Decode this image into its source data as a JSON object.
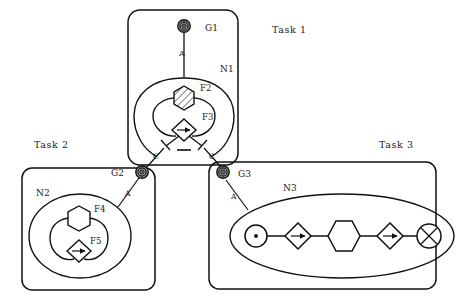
{
  "diagram": {
    "title_labels": [
      {
        "id": "task1",
        "text": "Task  1",
        "x": 272,
        "y": 33
      },
      {
        "id": "task2",
        "text": "Task  2",
        "x": 34,
        "y": 148
      },
      {
        "id": "task3",
        "text": "Task  3",
        "x": 379,
        "y": 148
      }
    ],
    "tasks": [
      {
        "id": "task-1",
        "label": "Task  1",
        "box": {
          "x": 128,
          "y": 10,
          "w": 110,
          "h": 155,
          "rx": 12
        },
        "goal": {
          "id": "G1",
          "label": "G1",
          "label_x": 205,
          "label_y": 32,
          "cx": 184,
          "cy": 26,
          "r": 6,
          "icon": "target-icon"
        },
        "edge": {
          "label": "A",
          "label_x": 180,
          "label_y": 56,
          "from": [
            184,
            33
          ],
          "to": [
            184,
            78
          ]
        },
        "net": {
          "id": "N1",
          "label": "N1",
          "label_x": 222,
          "label_y": 71,
          "features": [
            {
              "id": "F2",
              "label": "F2",
              "label_x": 202,
              "label_y": 90,
              "shape": "hexagon-hatched",
              "cx": 184,
              "cy": 98
            },
            {
              "id": "F3",
              "label": "F3",
              "label_x": 204,
              "label_y": 119,
              "shape": "diamond-arrow",
              "cx": 184,
              "cy": 130
            }
          ]
        },
        "out_edges": [
          {
            "label": "C",
            "label_x": 156,
            "label_y": 156
          },
          {
            "label": "C",
            "label_x": 212,
            "label_y": 156
          }
        ]
      },
      {
        "id": "task-2",
        "label": "Task  2",
        "box": {
          "x": 22,
          "y": 168,
          "w": 133,
          "h": 122,
          "rx": 10
        },
        "goal": {
          "id": "G2",
          "label": "G2",
          "label_x": 113,
          "label_y": 174,
          "cx": 142,
          "cy": 172,
          "r": 6,
          "icon": "target-icon"
        },
        "edge": {
          "label": "A",
          "label_x": 128,
          "label_y": 194
        },
        "net": {
          "id": "N2",
          "label": "N2",
          "label_x": 38,
          "label_y": 194,
          "features": [
            {
              "id": "F4",
              "label": "F4",
              "label_x": 96,
              "label_y": 211,
              "shape": "hexagon",
              "cx": 79,
              "cy": 218
            },
            {
              "id": "F5",
              "label": "F5",
              "label_x": 92,
              "label_y": 243,
              "shape": "diamond-arrow",
              "cx": 79,
              "cy": 251
            }
          ]
        }
      },
      {
        "id": "task-3",
        "label": "Task  3",
        "box": {
          "x": 209,
          "y": 162,
          "w": 227,
          "h": 127,
          "rx": 10
        },
        "goal": {
          "id": "G3",
          "label": "G3",
          "label_x": 240,
          "label_y": 175,
          "cx": 223,
          "cy": 172,
          "r": 6,
          "icon": "target-icon"
        },
        "edge": {
          "label": "A",
          "label_x": 233,
          "label_y": 197
        },
        "net": {
          "id": "N3",
          "label": "N3",
          "label_x": 285,
          "label_y": 190,
          "chain": [
            {
              "id": "n3-start",
              "shape": "circle-dot",
              "cx": 256,
              "cy": 236,
              "r": 11
            },
            {
              "id": "n3-op1",
              "shape": "diamond-arrow",
              "cx": 298,
              "cy": 236,
              "r": 13
            },
            {
              "id": "n3-mid",
              "shape": "hexagon",
              "cx": 344,
              "cy": 236,
              "r": 16
            },
            {
              "id": "n3-op2",
              "shape": "diamond-arrow",
              "cx": 390,
              "cy": 236,
              "r": 13
            },
            {
              "id": "n3-end",
              "shape": "circle-cross",
              "cx": 429,
              "cy": 236,
              "r": 12
            }
          ]
        }
      }
    ],
    "colors": {
      "stroke": "#111111",
      "background": "#ffffff",
      "label": "#1a1a1a",
      "hatch": "#555555",
      "goal_fill": "#8c8c8c"
    }
  }
}
